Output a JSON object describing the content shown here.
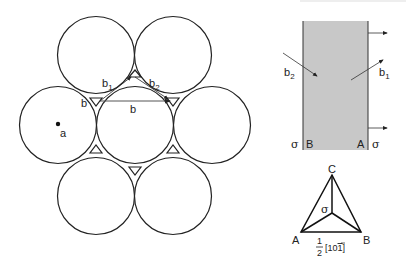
{
  "packing_diagram": {
    "labels": {
      "b1": "b",
      "b1_sub": "1",
      "b2": "b",
      "b2_sub": "2",
      "b_left": "b",
      "b_center": "b",
      "a": "a"
    }
  },
  "slip_band": {
    "labels": {
      "b2": "b",
      "b2_sub": "2",
      "b1": "b",
      "b1_sub": "1",
      "sigma_left": "σ",
      "B": "B",
      "A": "A",
      "sigma_right": "σ"
    },
    "fill_color": "#c8c8c8"
  },
  "thompson_triangle": {
    "labels": {
      "C": "C",
      "A": "A",
      "B": "B",
      "sigma": "σ",
      "frac_num": "1",
      "frac_den": "2",
      "vector": "[10",
      "vector_bar": "1",
      "vector_close": "]"
    }
  }
}
